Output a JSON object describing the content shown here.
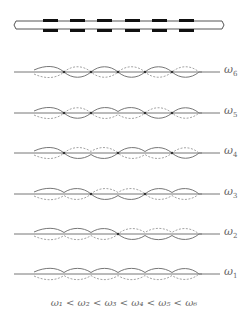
{
  "structure": {
    "description": "periodic rod with 6 mass segments",
    "segments": 6
  },
  "modes": [
    {
      "label": "ω",
      "sub": "6",
      "baseline_y": 72,
      "signs": [
        1,
        -1,
        1,
        -1,
        1,
        -1
      ]
    },
    {
      "label": "ω",
      "sub": "5",
      "baseline_y": 113,
      "signs": [
        1,
        -1,
        1,
        1,
        -1,
        1
      ]
    },
    {
      "label": "ω",
      "sub": "4",
      "baseline_y": 153,
      "signs": [
        1,
        -1,
        -1,
        1,
        1,
        -1
      ]
    },
    {
      "label": "ω",
      "sub": "3",
      "baseline_y": 194,
      "signs": [
        1,
        1,
        -1,
        -1,
        1,
        1
      ]
    },
    {
      "label": "ω",
      "sub": "2",
      "baseline_y": 234,
      "signs": [
        1,
        1,
        1,
        -1,
        -1,
        -1
      ]
    },
    {
      "label": "ω",
      "sub": "1",
      "baseline_y": 274,
      "signs": [
        1,
        1,
        1,
        1,
        1,
        1
      ]
    }
  ],
  "caption": "ω₁ < ω₂ < ω₃ < ω₄ < ω₅ < ω₆",
  "colors": {
    "line": "#666666",
    "solid_curve": "#777777",
    "dashed_curve": "#999999",
    "mass": "#111111"
  }
}
